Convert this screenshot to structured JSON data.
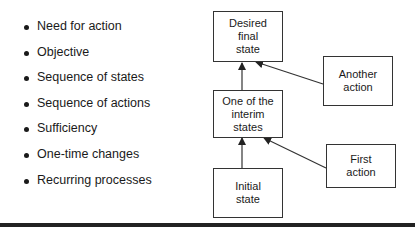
{
  "bullets": [
    "Need for action",
    "Objective",
    "Sequence of states",
    "Sequence of actions",
    "Sufficiency",
    "One-time changes",
    "Recurring processes"
  ],
  "diagram": {
    "desired": "Desired\nfinal\nstate",
    "another_action": "Another\naction",
    "interim": "One of the\ninterim\nstates",
    "first_action": "First\naction",
    "initial": "Initial\nstate"
  }
}
